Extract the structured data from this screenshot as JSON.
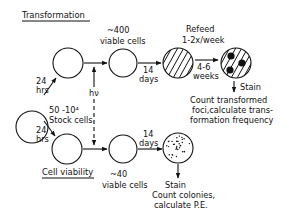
{
  "diagram": {
    "sections": {
      "transformation_title": "Transformation",
      "viability_title": "Cell viability"
    },
    "stock": {
      "line1": "50 -10⁴",
      "line2": "Stock cells"
    },
    "time_labels": {
      "top_24_line1": "24",
      "top_24_line2": "hrs",
      "bottom_24_line1": "24",
      "bottom_24_line2": "hrs",
      "top_14_line1": "14",
      "top_14_line2": "days",
      "bottom_14_line1": "14",
      "bottom_14_line2": "days",
      "weeks_line1": "4-6",
      "weeks_line2": "weeks"
    },
    "irradiation_label": "hν",
    "top_viable": {
      "line1": "~400",
      "line2": "viable cells"
    },
    "bottom_viable": {
      "line1": "~40",
      "line2": "viable cells"
    },
    "refeed": {
      "line1": "Refeed",
      "line2": "1-2x/week"
    },
    "top_result": {
      "stain": "Stain",
      "line1": "Count transformed",
      "line2": "foci,calculate trans-",
      "line3": "formation frequency"
    },
    "bottom_result": {
      "stain": "Stain",
      "line1": "Count colonies,",
      "line2": "calculate P.E."
    }
  }
}
